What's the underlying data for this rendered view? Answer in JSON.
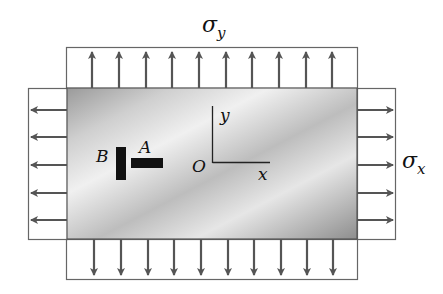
{
  "diagram": {
    "type": "biaxial-stress-plate",
    "labels": {
      "sigma_y": "σ",
      "sigma_y_sub": "y",
      "sigma_x": "σ",
      "sigma_x_sub": "x",
      "element_a": "A",
      "element_b": "B",
      "origin": "O",
      "axis_x": "x",
      "axis_y": "y"
    },
    "arrows": {
      "top_count": 10,
      "bottom_count": 10,
      "left_count": 5,
      "right_count": 5
    },
    "colors": {
      "arrow": "#555555",
      "box_border": "#666666",
      "plate_light": "#f2f2f2",
      "plate_dark": "#8a8a8a",
      "strain_gage": "#111111"
    }
  }
}
